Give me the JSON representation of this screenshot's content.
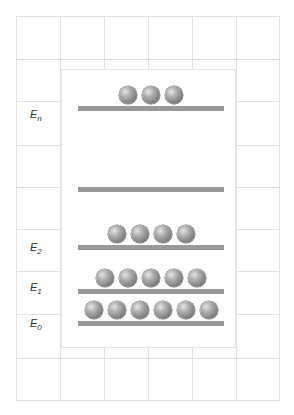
{
  "diagram": {
    "type": "energy-level-population",
    "levels": [
      {
        "id": "En",
        "label": "E",
        "subscript": "n",
        "particles": 3,
        "bar_y": 106,
        "label_y": 108
      },
      {
        "id": "gap",
        "label": "",
        "subscript": "",
        "particles": 0,
        "bar_y": 187,
        "label_y": null
      },
      {
        "id": "E2",
        "label": "E",
        "subscript": "2",
        "particles": 4,
        "bar_y": 245,
        "label_y": 241
      },
      {
        "id": "E1",
        "label": "E",
        "subscript": "1",
        "particles": 5,
        "bar_y": 289,
        "label_y": 281
      },
      {
        "id": "E0",
        "label": "E",
        "subscript": "0",
        "particles": 6,
        "bar_y": 321,
        "label_y": 317
      }
    ],
    "colors": {
      "grid": "#e2e2e2",
      "bar": "#999999",
      "particle": "#8a8a8a",
      "label": "#333333"
    }
  }
}
